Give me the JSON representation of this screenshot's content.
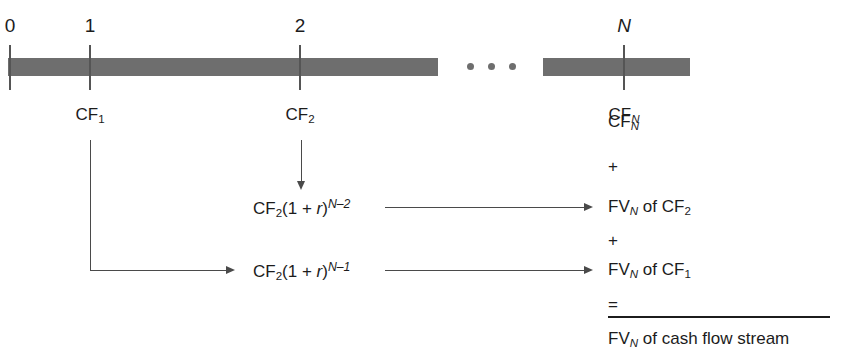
{
  "diagram": {
    "bar_color": "#6e6e6e",
    "line_color": "#4a4a4a",
    "text_color": "#1c1c1c"
  },
  "timeline": {
    "periods": [
      {
        "number": "0",
        "cash_flow": null
      },
      {
        "number": "1",
        "cash_flow": "CF",
        "cash_flow_sub": "1"
      },
      {
        "number": "2",
        "cash_flow": "CF",
        "cash_flow_sub": "2"
      },
      {
        "number": "N",
        "cash_flow": "CF",
        "cash_flow_sub": "N"
      }
    ],
    "ellipsis": "• • •"
  },
  "labels": {
    "period_0": "0",
    "period_1": "1",
    "period_2": "2",
    "period_N": "N",
    "cf_1": "CF",
    "cf_1_sub": "1",
    "cf_2": "CF",
    "cf_2_sub": "2",
    "cf_N": "CF",
    "cf_N_sub": "N"
  },
  "compounding_rows": [
    {
      "formula_base": "CF",
      "formula_sub": "2",
      "formula_factor": "(1 + ",
      "formula_rate": "r",
      "formula_close": ")",
      "formula_exponent": "N–2",
      "result_base": "FV",
      "result_sub": "N",
      "result_of": " of CF",
      "result_of_sub": "2"
    },
    {
      "formula_base": "CF",
      "formula_sub": "2",
      "formula_factor": "(1 + ",
      "formula_rate": "r",
      "formula_close": ")",
      "formula_exponent": "N–1",
      "result_base": "FV",
      "result_sub": "N",
      "result_of": " of CF",
      "result_of_sub": "1"
    }
  ],
  "summation": {
    "term_1": "CF",
    "term_1_sub": "N",
    "plus_1": "+",
    "term_2": "FV",
    "term_2_sub": "N",
    "term_2_of": " of CF",
    "term_2_of_sub": "2",
    "plus_2": "+",
    "term_3": "FV",
    "term_3_sub": "N",
    "term_3_of": " of CF",
    "term_3_of_sub": "1",
    "equals": "=",
    "total": "FV",
    "total_sub": "N",
    "total_of": " of cash flow stream"
  }
}
